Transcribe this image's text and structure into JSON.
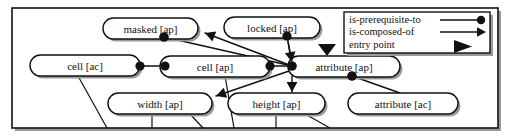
{
  "diagram": {
    "frame": {
      "x": 12,
      "y": 8,
      "width": 486,
      "height": 120,
      "stroke": "#111111",
      "fill": "#ffffff"
    },
    "colors": {
      "node_stroke": "#111111",
      "node_fill": "#ffffff",
      "edge": "#111111",
      "shadow": "#9a9a9a",
      "text": "#111111",
      "background": "#ffffff"
    },
    "nodes": [
      {
        "id": "masked-ap",
        "label": "masked [ap]",
        "x": 103,
        "y": 18,
        "w": 95,
        "h": 21
      },
      {
        "id": "locked-ap",
        "label": "locked [ap]",
        "x": 224,
        "y": 17,
        "w": 96,
        "h": 21
      },
      {
        "id": "cell-ac",
        "label": "cell [ac]",
        "x": 30,
        "y": 55,
        "w": 110,
        "h": 21
      },
      {
        "id": "cell-ap",
        "label": "cell [ap]",
        "x": 160,
        "y": 56,
        "w": 110,
        "h": 21
      },
      {
        "id": "attribute-ap",
        "label": "attribute [ap]",
        "x": 288,
        "y": 56,
        "w": 112,
        "h": 21
      },
      {
        "id": "width-ap",
        "label": "width [ap]",
        "x": 108,
        "y": 93,
        "w": 104,
        "h": 21
      },
      {
        "id": "height-ap",
        "label": "height [ap]",
        "x": 228,
        "y": 93,
        "w": 97,
        "h": 21
      },
      {
        "id": "attribute-ac",
        "label": "attribute [ac]",
        "x": 348,
        "y": 93,
        "w": 110,
        "h": 21
      }
    ],
    "edges": [
      {
        "from": "cell-ac",
        "to": "cell-ap",
        "kind": "is-prerequisite-to",
        "x1": 140,
        "y1": 66,
        "x2": 165,
        "y2": 66
      },
      {
        "from": "cell-ap",
        "to": "attribute-ap",
        "kind": "is-prerequisite-to",
        "x1": 270,
        "y1": 66,
        "x2": 292,
        "y2": 66
      },
      {
        "from": "masked-ap",
        "to": "attribute-ap",
        "kind": "is-prerequisite-to",
        "x1": 164,
        "y1": 37,
        "x2": 292,
        "y2": 66
      },
      {
        "from": "attribute-ap",
        "to": "locked-ap",
        "kind": "is-prerequisite-to",
        "x1": 292,
        "y1": 66,
        "x2": 287,
        "y2": 36
      },
      {
        "from": "attribute-ap",
        "to": "masked-ap",
        "kind": "is-composed-of",
        "x1": 292,
        "y1": 66,
        "x2": 205,
        "y2": 33
      },
      {
        "from": "locked-ap",
        "to": "attribute-ap",
        "kind": "is-composed-of",
        "x1": 287,
        "y1": 36,
        "x2": 292,
        "y2": 62
      },
      {
        "from": "attribute-ap",
        "to": "width-ap",
        "kind": "is-composed-of",
        "x1": 292,
        "y1": 70,
        "x2": 216,
        "y2": 96
      },
      {
        "from": "attribute-ap",
        "to": "height-ap",
        "kind": "is-composed-of",
        "x1": 292,
        "y1": 76,
        "x2": 292,
        "y2": 92
      },
      {
        "from": "attribute-ap",
        "to": "attribute-ac",
        "kind": "is-prerequisite-to",
        "x1": 352,
        "y1": 76,
        "x2": 400,
        "y2": 93
      },
      {
        "from": "cell-ac",
        "to": "below",
        "kind": "plain",
        "x1": 78,
        "y1": 76,
        "x2": 107,
        "y2": 128
      },
      {
        "from": "cell-ap",
        "to": "below",
        "kind": "plain",
        "x1": 225,
        "y1": 76,
        "x2": 234,
        "y2": 128
      },
      {
        "from": "width-ap",
        "to": "below",
        "kind": "plain",
        "x1": 152,
        "y1": 114,
        "x2": 152,
        "y2": 128
      },
      {
        "from": "width-ap",
        "to": "below-right",
        "kind": "plain",
        "x1": 190,
        "y1": 114,
        "x2": 203,
        "y2": 128
      },
      {
        "from": "height-ap",
        "to": "below",
        "kind": "plain",
        "x1": 276,
        "y1": 114,
        "x2": 276,
        "y2": 128
      },
      {
        "from": "height-ap",
        "to": "below-right",
        "kind": "plain",
        "x1": 305,
        "y1": 114,
        "x2": 330,
        "y2": 128
      }
    ],
    "entry_points": [
      {
        "target": "attribute-ap",
        "x": 327,
        "y": 44
      }
    ]
  },
  "legend": {
    "box": {
      "x": 344,
      "y": 12,
      "width": 146,
      "height": 41
    },
    "items": [
      {
        "label": "is-prerequisite-to",
        "marker": "line-with-filled-circle"
      },
      {
        "label": "is-composed-of",
        "marker": "line-with-arrowhead"
      },
      {
        "label": "entry point",
        "marker": "filled-triangle"
      }
    ]
  }
}
